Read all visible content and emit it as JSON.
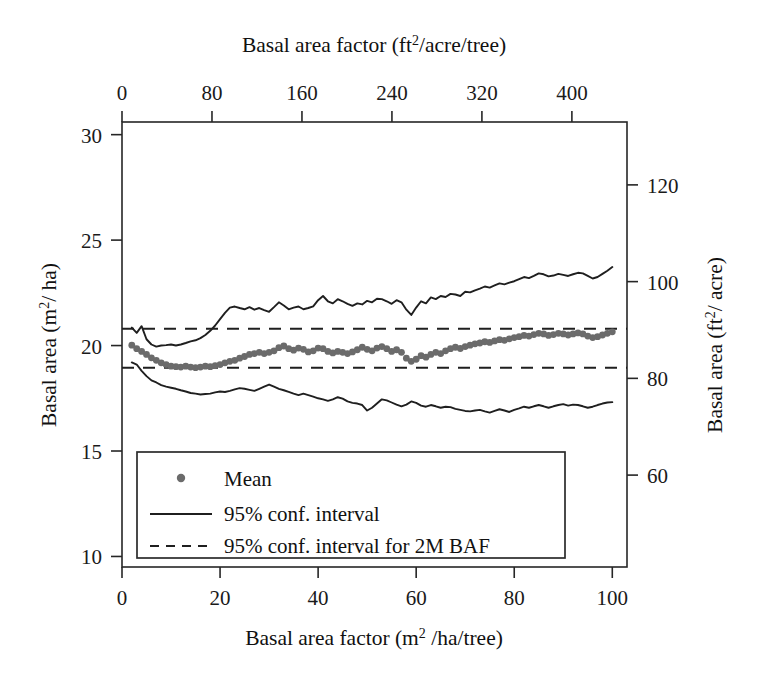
{
  "chart_data": {
    "type": "line",
    "title": "",
    "xlabel": "Basal area factor (m2 /ha/tree)",
    "ylabel": "Basal area (m2/ ha)",
    "xlabel_top": "Basal area factor (ft2/acre/tree)",
    "ylabel_right": "Basal area (ft2/ acre)",
    "xlim": [
      0,
      103
    ],
    "ylim": [
      9.5,
      30.6
    ],
    "xlim_top": [
      0,
      449
    ],
    "ylim_right": [
      41,
      133
    ],
    "xticks": [
      0,
      20,
      40,
      60,
      80,
      100
    ],
    "yticks": [
      10,
      15,
      20,
      25,
      30
    ],
    "xticks_top": [
      0,
      80,
      160,
      240,
      320,
      400
    ],
    "yticks_right": [
      60,
      80,
      100,
      120
    ],
    "grid": false,
    "legend_position": "lower-left-inside",
    "x": [
      2,
      3,
      4,
      5,
      6,
      7,
      8,
      9,
      10,
      11,
      12,
      13,
      14,
      15,
      16,
      17,
      18,
      19,
      20,
      21,
      22,
      23,
      24,
      25,
      26,
      27,
      28,
      29,
      30,
      31,
      32,
      33,
      34,
      35,
      36,
      37,
      38,
      39,
      40,
      41,
      42,
      43,
      44,
      45,
      46,
      47,
      48,
      49,
      50,
      51,
      52,
      53,
      54,
      55,
      56,
      57,
      58,
      59,
      60,
      61,
      62,
      63,
      64,
      65,
      66,
      67,
      68,
      69,
      70,
      71,
      72,
      73,
      74,
      75,
      76,
      77,
      78,
      79,
      80,
      81,
      82,
      83,
      84,
      85,
      86,
      87,
      88,
      89,
      90,
      91,
      92,
      93,
      94,
      95,
      96,
      97,
      98,
      99,
      100
    ],
    "series": [
      {
        "name": "95% conf. interval upper",
        "style": "solid",
        "color": "#1f1f1f",
        "values": [
          20.85,
          20.6,
          20.92,
          20.3,
          20.05,
          19.95,
          20.0,
          20.02,
          20.05,
          20.0,
          20.05,
          20.12,
          20.2,
          20.25,
          20.35,
          20.5,
          20.7,
          20.95,
          21.25,
          21.55,
          21.8,
          21.85,
          21.78,
          21.72,
          21.82,
          21.7,
          21.78,
          21.68,
          21.6,
          21.82,
          22.05,
          21.9,
          21.72,
          21.8,
          21.85,
          21.72,
          21.78,
          21.86,
          22.15,
          22.35,
          22.1,
          22.0,
          22.2,
          22.1,
          21.98,
          21.88,
          22.0,
          21.95,
          22.12,
          22.05,
          22.22,
          22.2,
          22.1,
          21.98,
          22.15,
          22.05,
          21.7,
          21.45,
          21.8,
          22.1,
          22.0,
          22.28,
          22.2,
          22.35,
          22.3,
          22.45,
          22.42,
          22.35,
          22.55,
          22.52,
          22.62,
          22.7,
          22.8,
          22.75,
          22.85,
          22.95,
          22.9,
          22.98,
          23.05,
          23.15,
          23.25,
          23.2,
          23.3,
          23.42,
          23.38,
          23.28,
          23.32,
          23.4,
          23.35,
          23.3,
          23.38,
          23.45,
          23.42,
          23.3,
          23.18,
          23.25,
          23.4,
          23.55,
          23.72
        ]
      },
      {
        "name": "Mean",
        "style": "dots",
        "color": "#6b6b6b",
        "values": [
          20.02,
          19.85,
          19.72,
          19.58,
          19.42,
          19.3,
          19.18,
          19.1,
          19.02,
          19.0,
          18.98,
          19.02,
          18.98,
          18.95,
          18.98,
          19.02,
          19.0,
          19.05,
          19.1,
          19.18,
          19.25,
          19.3,
          19.4,
          19.48,
          19.58,
          19.62,
          19.68,
          19.62,
          19.68,
          19.75,
          19.9,
          19.98,
          19.85,
          19.78,
          19.88,
          19.82,
          19.7,
          19.75,
          19.88,
          19.85,
          19.72,
          19.65,
          19.72,
          19.68,
          19.62,
          19.7,
          19.8,
          19.92,
          19.82,
          19.75,
          19.88,
          19.95,
          19.85,
          19.72,
          19.8,
          19.68,
          19.4,
          19.25,
          19.35,
          19.52,
          19.45,
          19.58,
          19.68,
          19.62,
          19.75,
          19.85,
          19.92,
          19.86,
          19.95,
          20.02,
          20.08,
          20.12,
          20.18,
          20.15,
          20.22,
          20.28,
          20.25,
          20.32,
          20.38,
          20.42,
          20.48,
          20.45,
          20.52,
          20.58,
          20.55,
          20.48,
          20.52,
          20.58,
          20.55,
          20.5,
          20.55,
          20.6,
          20.55,
          20.45,
          20.38,
          20.42,
          20.5,
          20.58,
          20.65
        ]
      },
      {
        "name": "95% conf. interval lower",
        "style": "solid",
        "color": "#1f1f1f",
        "values": [
          19.2,
          19.1,
          18.8,
          18.55,
          18.35,
          18.25,
          18.12,
          18.05,
          18.0,
          17.95,
          17.88,
          17.82,
          17.75,
          17.72,
          17.68,
          17.7,
          17.72,
          17.78,
          17.82,
          17.8,
          17.85,
          17.92,
          17.98,
          17.95,
          17.9,
          17.85,
          17.95,
          18.05,
          18.15,
          18.05,
          17.95,
          17.88,
          17.8,
          17.72,
          17.65,
          17.72,
          17.65,
          17.58,
          17.5,
          17.45,
          17.38,
          17.45,
          17.55,
          17.48,
          17.35,
          17.28,
          17.25,
          17.18,
          16.92,
          17.05,
          17.25,
          17.45,
          17.4,
          17.3,
          17.2,
          17.12,
          17.2,
          17.35,
          17.28,
          17.15,
          17.1,
          17.18,
          17.12,
          17.05,
          17.1,
          17.08,
          17.0,
          16.95,
          16.9,
          16.88,
          16.92,
          16.95,
          16.88,
          16.82,
          16.9,
          16.98,
          16.92,
          16.85,
          16.95,
          17.02,
          17.1,
          17.05,
          17.12,
          17.18,
          17.12,
          17.05,
          17.12,
          17.18,
          17.22,
          17.15,
          17.2,
          17.18,
          17.12,
          17.05,
          17.1,
          17.18,
          17.25,
          17.3,
          17.32
        ]
      },
      {
        "name": "95% conf. interval for 2M BAF upper",
        "style": "dashed",
        "color": "#1f1f1f",
        "constant": 20.8
      },
      {
        "name": "95% conf. interval for 2M BAF lower",
        "style": "dashed",
        "color": "#1f1f1f",
        "constant": 18.95
      }
    ],
    "legend": [
      {
        "label": "Mean",
        "marker": "dot"
      },
      {
        "label": "95% conf. interval",
        "marker": "solid-line"
      },
      {
        "label": "95% conf. interval for 2M BAF",
        "marker": "dashed-line"
      }
    ]
  },
  "axes": {
    "bottom": {
      "title_main": "Basal area factor (m",
      "title_sup": "2",
      "title_tail": " /ha/tree)",
      "ticks": [
        "0",
        "20",
        "40",
        "60",
        "80",
        "100"
      ]
    },
    "top": {
      "title_main": "Basal area factor (ft",
      "title_sup": "2",
      "title_tail": "/acre/tree)",
      "ticks": [
        "0",
        "80",
        "160",
        "240",
        "320",
        "400"
      ]
    },
    "left": {
      "title_main": "Basal area (m",
      "title_sup": "2",
      "title_tail": "/ ha)",
      "ticks": [
        "30",
        "25",
        "20",
        "15",
        "10"
      ]
    },
    "right": {
      "title_main": "Basal area (ft",
      "title_sup": "2",
      "title_tail": "/ acre)",
      "ticks": [
        "120",
        "100",
        "80",
        "60"
      ]
    }
  },
  "colors": {
    "axis": "#262626",
    "line": "#1f1f1f",
    "mean_marker": "#6b6b6b",
    "background": "#ffffff"
  }
}
